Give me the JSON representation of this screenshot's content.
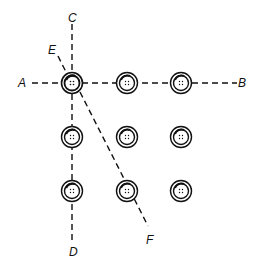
{
  "diagram": {
    "type": "button-grid-sewing-lines",
    "grid": {
      "rows": 3,
      "cols": 3,
      "x": [
        72,
        127,
        181
      ],
      "y": [
        83,
        137,
        191
      ],
      "outer_radius": 10,
      "inner_radius": 7
    },
    "labels": {
      "A": "A",
      "B": "B",
      "C": "C",
      "D": "D",
      "E": "E",
      "F": "F"
    },
    "lines": [
      {
        "name": "line-A-B",
        "from": "A",
        "to": "B",
        "description": "horizontal dashed line through top row"
      },
      {
        "name": "line-C-D",
        "from": "C",
        "to": "D",
        "description": "vertical dashed line through left column"
      },
      {
        "name": "line-E",
        "from": "E",
        "to": "top-left-button",
        "description": "short dashed pointer"
      },
      {
        "name": "line-F",
        "from": "top-left-button",
        "to": "F",
        "description": "diagonal dashed line"
      }
    ],
    "colors": {
      "stroke": "#111111",
      "background": "#ffffff"
    }
  }
}
